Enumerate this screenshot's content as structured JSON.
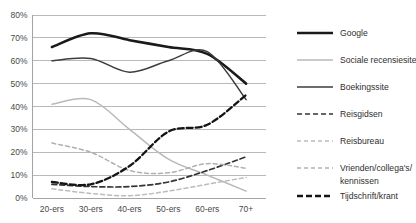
{
  "chart_data": {
    "type": "line",
    "title": "",
    "xlabel": "",
    "ylabel": "",
    "categories": [
      "20-ers",
      "30-ers",
      "40-ers",
      "50-ers",
      "60-ers",
      "70+"
    ],
    "ylim": [
      0,
      80
    ],
    "yticks": [
      "0%",
      "10%",
      "20%",
      "30%",
      "40%",
      "50%",
      "60%",
      "70%",
      "80%"
    ],
    "ytick_values": [
      0,
      10,
      20,
      30,
      40,
      50,
      60,
      70,
      80
    ],
    "grid": true,
    "legend_position": "right",
    "series": [
      {
        "name": "Google",
        "values": [
          66,
          72,
          69,
          66,
          63,
          50
        ],
        "color": "#1a1a1a",
        "width": 2.6,
        "dash": "none"
      },
      {
        "name": "Sociale recensiesite",
        "values": [
          41,
          43,
          30,
          17,
          10,
          3
        ],
        "color": "#b9b9b9",
        "width": 1.5,
        "dash": "none"
      },
      {
        "name": "Boekingssite",
        "values": [
          60,
          61,
          55,
          60,
          64,
          43
        ],
        "color": "#3c3c3c",
        "width": 1.5,
        "dash": "none"
      },
      {
        "name": "Reisgidsen",
        "values": [
          6,
          5,
          5,
          7,
          12,
          18
        ],
        "color": "#353535",
        "width": 1.7,
        "dash": "5,3"
      },
      {
        "name": "Reisbureau",
        "values": [
          4,
          2,
          1,
          3,
          6,
          9
        ],
        "color": "#bcbcbc",
        "width": 1.5,
        "dash": "4,3"
      },
      {
        "name": "Vrienden/collega's/kennissen",
        "values": [
          24,
          20,
          12,
          11,
          15,
          13
        ],
        "color": "#b0b0b0",
        "width": 1.5,
        "dash": "4,3"
      },
      {
        "name": "Tijdschrift/krant",
        "values": [
          7,
          6,
          14,
          29,
          32,
          45
        ],
        "color": "#141414",
        "width": 2.3,
        "dash": "6,3"
      }
    ]
  },
  "legend": {
    "items": [
      {
        "label": "Google"
      },
      {
        "label": "Sociale recensiesite"
      },
      {
        "label": "Boekingssite"
      },
      {
        "label": "Reisgidsen"
      },
      {
        "label": "Reisbureau"
      },
      {
        "label": "Vrienden/collega's/"
      },
      {
        "label": "kennissen"
      },
      {
        "label": "Tijdschrift/krant"
      }
    ]
  }
}
